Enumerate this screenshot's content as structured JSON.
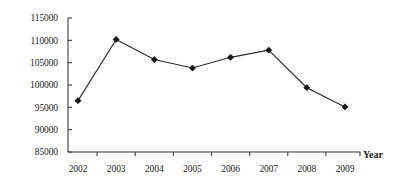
{
  "chart_data": {
    "type": "line",
    "title": "",
    "subtitle": "",
    "xlabel": "Year",
    "ylabel": "",
    "categories": [
      "2002",
      "2003",
      "2004",
      "2005",
      "2006",
      "2007",
      "2008",
      "2009"
    ],
    "values": [
      96500,
      110200,
      105700,
      103800,
      106200,
      107800,
      99400,
      95100
    ],
    "series": [
      {
        "name": "",
        "values": [
          96500,
          110200,
          105700,
          103800,
          106200,
          107800,
          99400,
          95100
        ]
      }
    ],
    "ylim": [
      85000,
      115000
    ],
    "ytick_values": [
      85000,
      90000,
      95000,
      100000,
      105000,
      110000,
      115000
    ],
    "ytick_labels": [
      "85000",
      "90000",
      "95000",
      "100000",
      "105000",
      "110000",
      "115000"
    ],
    "xtick_labels": [
      "2002",
      "2003",
      "2004",
      "2005",
      "2006",
      "2007",
      "2008",
      "2009"
    ],
    "grid": false,
    "legend": false,
    "legend_position": "none",
    "marker": "diamond",
    "line_color": "#2b2b2b",
    "marker_color": "#121212",
    "axis_color": "#3a3a3a",
    "background_color": "#ffffff"
  },
  "axis": {
    "x_title": "Year"
  }
}
